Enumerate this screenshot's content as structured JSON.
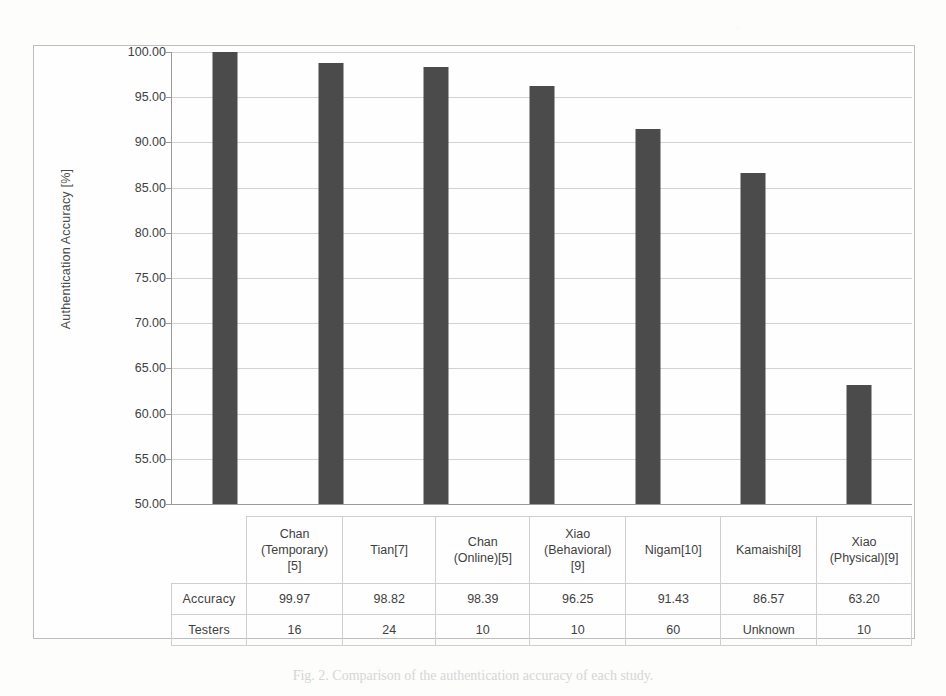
{
  "figure": {
    "caption": "Fig. 2.  Comparison of the authentication accuracy of each study.",
    "y_axis_title": "Authentication Accuracy [%]",
    "bar_color": "#4b4b4b",
    "gridline_color": "#d2d2d2",
    "axis_color": "#9a9a9a"
  },
  "table": {
    "row_headers": [
      "Accuracy",
      "Testers"
    ]
  },
  "chart_data": {
    "type": "bar",
    "title": "",
    "xlabel": "",
    "ylabel": "Authentication Accuracy [%]",
    "ylim": [
      50.0,
      100.0
    ],
    "grid": true,
    "legend": "none",
    "ytick_labels": [
      "100.00",
      "95.00",
      "90.00",
      "85.00",
      "80.00",
      "75.00",
      "70.00",
      "65.00",
      "60.00",
      "55.00",
      "50.00"
    ],
    "yticks": [
      100.0,
      95.0,
      90.0,
      85.0,
      80.0,
      75.0,
      70.0,
      65.0,
      60.0,
      55.0,
      50.0
    ],
    "categories": [
      "Chan\n(Temporary)\n[5]",
      "Tian[7]",
      "Chan\n(Online)[5]",
      "Xiao\n(Behavioral)\n[9]",
      "Nigam[10]",
      "Kamaishi[8]",
      "Xiao\n(Physical)[9]"
    ],
    "category_lines": [
      [
        "Chan",
        "(Temporary)",
        "[5]"
      ],
      [
        "Tian[7]"
      ],
      [
        "Chan",
        "(Online)[5]"
      ],
      [
        "Xiao",
        "(Behavioral)",
        "[9]"
      ],
      [
        "Nigam[10]"
      ],
      [
        "Kamaishi[8]"
      ],
      [
        "Xiao",
        "(Physical)[9]"
      ]
    ],
    "values": [
      99.97,
      98.82,
      98.39,
      96.25,
      91.43,
      86.57,
      63.2
    ],
    "value_labels": [
      "99.97",
      "98.82",
      "98.39",
      "96.25",
      "91.43",
      "86.57",
      "63.20"
    ],
    "testers": [
      "16",
      "24",
      "10",
      "10",
      "60",
      "Unknown",
      "10"
    ]
  }
}
